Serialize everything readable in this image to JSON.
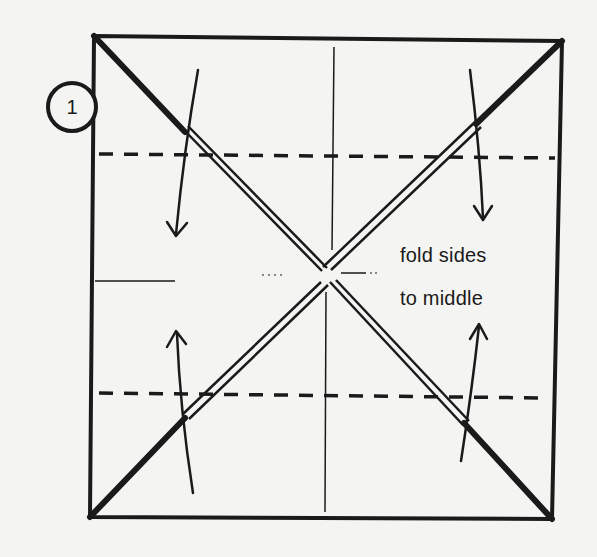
{
  "diagram": {
    "step": {
      "number": "1"
    },
    "instruction": {
      "line1": "fold sides",
      "line2": "to middle"
    },
    "colors": {
      "ink": "#1a1a1a",
      "paper": "#f4f4f2"
    }
  }
}
